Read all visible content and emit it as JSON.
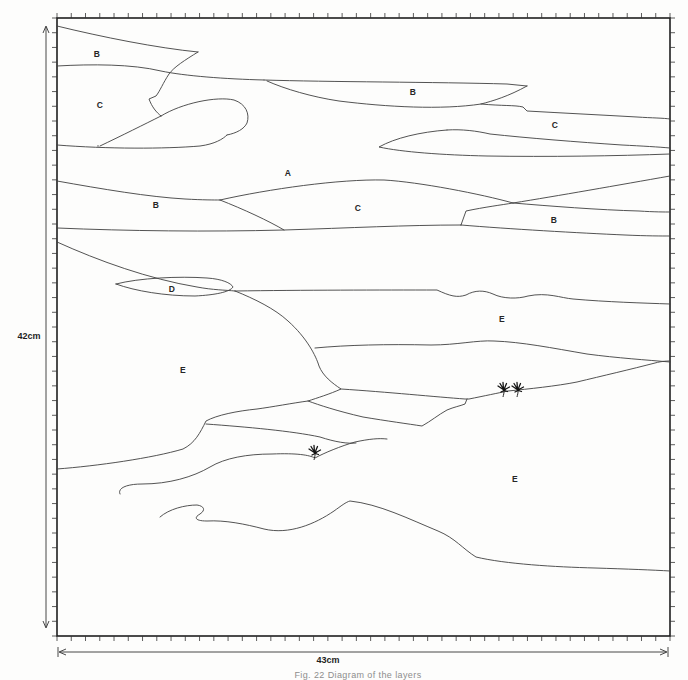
{
  "figure": {
    "caption": "Fig. 22 Diagram of the layers",
    "dimensions": {
      "height_label": "42cm",
      "width_label": "43cm"
    },
    "axes": {
      "x_tick_intervals": 43,
      "y_tick_intervals": 42
    },
    "region_labels": [
      {
        "text": "B",
        "x": 97,
        "y": 54
      },
      {
        "text": "C",
        "x": 100,
        "y": 105
      },
      {
        "text": "B",
        "x": 413,
        "y": 92
      },
      {
        "text": "C",
        "x": 555,
        "y": 125
      },
      {
        "text": "A",
        "x": 288,
        "y": 173
      },
      {
        "text": "B",
        "x": 156,
        "y": 205
      },
      {
        "text": "C",
        "x": 358,
        "y": 208
      },
      {
        "text": "B",
        "x": 554,
        "y": 220
      },
      {
        "text": "D",
        "x": 172,
        "y": 289
      },
      {
        "text": "E",
        "x": 502,
        "y": 319
      },
      {
        "text": "E",
        "x": 183,
        "y": 370
      },
      {
        "text": "E",
        "x": 515,
        "y": 479
      }
    ],
    "plants": [
      {
        "x": 315,
        "y": 452
      },
      {
        "x": 504,
        "y": 389
      },
      {
        "x": 518,
        "y": 389
      }
    ],
    "colors": {
      "paper": "#fdfdfc",
      "contour_line": "#3f3f3f",
      "border": "#1e1e1e",
      "label_text": "#262626",
      "caption_text": "#8d8d8d"
    }
  }
}
